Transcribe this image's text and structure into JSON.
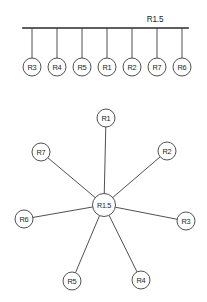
{
  "canvas": {
    "width": 207,
    "height": 302,
    "background": "#ffffff"
  },
  "colors": {
    "stroke": "#3c3c3c",
    "bus_stroke": "#2a2a2a",
    "node_fill": "#ffffff",
    "text": "#1c1c1c"
  },
  "chart_data": {
    "type": "diagram",
    "title": "",
    "panels": [
      {
        "name": "bus-topology",
        "topology": "bus",
        "backbone_label": "R1.5",
        "backbone": {
          "x1": 23,
          "x2": 188,
          "y": 28
        },
        "label_position": {
          "x": 155,
          "y": 19
        },
        "node_radius": 9,
        "nodes": [
          {
            "id": "R3",
            "label": "R3",
            "cx": 32,
            "cy": 67,
            "stem_top_y": 28
          },
          {
            "id": "R4",
            "label": "R4",
            "cx": 57,
            "cy": 67,
            "stem_top_y": 28
          },
          {
            "id": "R5",
            "label": "R5",
            "cx": 82,
            "cy": 67,
            "stem_top_y": 28
          },
          {
            "id": "R1",
            "label": "R1",
            "cx": 107,
            "cy": 67,
            "stem_top_y": 28
          },
          {
            "id": "R2",
            "label": "R2",
            "cx": 132,
            "cy": 67,
            "stem_top_y": 28
          },
          {
            "id": "R7",
            "label": "R7",
            "cx": 157,
            "cy": 67,
            "stem_top_y": 28
          },
          {
            "id": "R6",
            "label": "R6",
            "cx": 182,
            "cy": 67,
            "stem_top_y": 28
          }
        ]
      },
      {
        "name": "star-topology",
        "topology": "star",
        "hub": {
          "id": "R1.5",
          "label": "R1.5",
          "cx": 104,
          "cy": 205,
          "r": 11.5
        },
        "node_radius": 9,
        "nodes": [
          {
            "id": "R1",
            "label": "R1",
            "cx": 106,
            "cy": 118
          },
          {
            "id": "R2",
            "label": "R2",
            "cx": 167,
            "cy": 151
          },
          {
            "id": "R3",
            "label": "R3",
            "cx": 186,
            "cy": 221
          },
          {
            "id": "R4",
            "label": "R4",
            "cx": 141,
            "cy": 280
          },
          {
            "id": "R5",
            "label": "R5",
            "cx": 72,
            "cy": 281
          },
          {
            "id": "R6",
            "label": "R6",
            "cx": 24,
            "cy": 219
          },
          {
            "id": "R7",
            "label": "R7",
            "cx": 41,
            "cy": 152
          }
        ],
        "edges": [
          {
            "from": "R1.5",
            "to": "R1"
          },
          {
            "from": "R1.5",
            "to": "R2"
          },
          {
            "from": "R1.5",
            "to": "R3"
          },
          {
            "from": "R1.5",
            "to": "R4"
          },
          {
            "from": "R1.5",
            "to": "R5"
          },
          {
            "from": "R1.5",
            "to": "R6"
          },
          {
            "from": "R1.5",
            "to": "R7"
          }
        ]
      }
    ]
  }
}
